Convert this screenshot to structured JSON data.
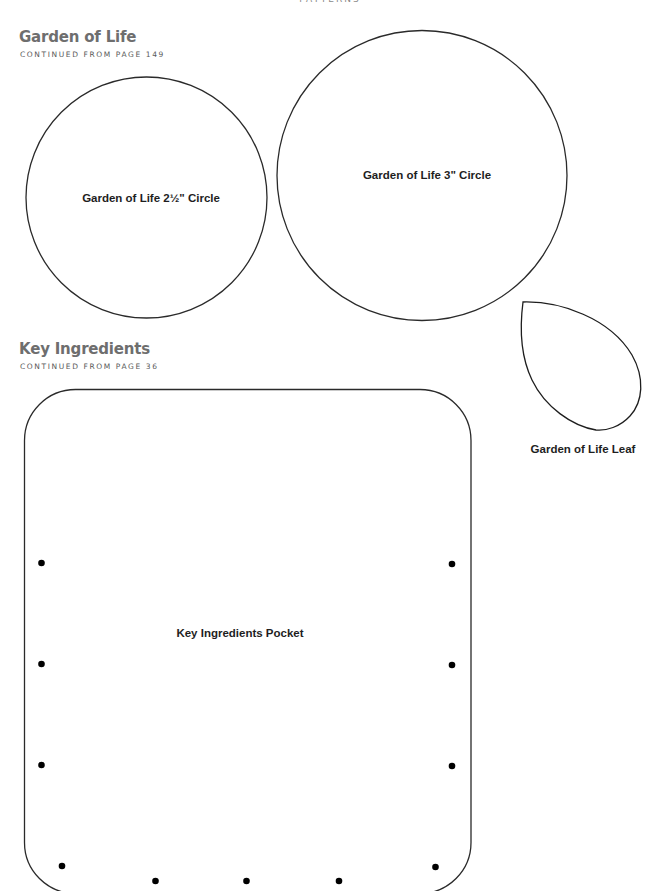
{
  "page": {
    "running_head": "PATTERNS"
  },
  "sections": [
    {
      "title": "Garden of Life",
      "subtitle": "CONTINUED FROM PAGE 149"
    },
    {
      "title": "Key Ingredients",
      "subtitle": "CONTINUED FROM PAGE 36"
    }
  ],
  "patterns": {
    "circle_small": {
      "label": "Garden of Life 2½\" Circle"
    },
    "circle_large": {
      "label": "Garden of Life 3\" Circle"
    },
    "leaf": {
      "label": "Garden of Life Leaf"
    },
    "pocket": {
      "label": "Key Ingredients Pocket"
    }
  },
  "colors": {
    "title": "#6e6e6e",
    "subtitle": "#5a5a5a",
    "outline": "#2a2a2a",
    "label": "#1e1e1e"
  }
}
